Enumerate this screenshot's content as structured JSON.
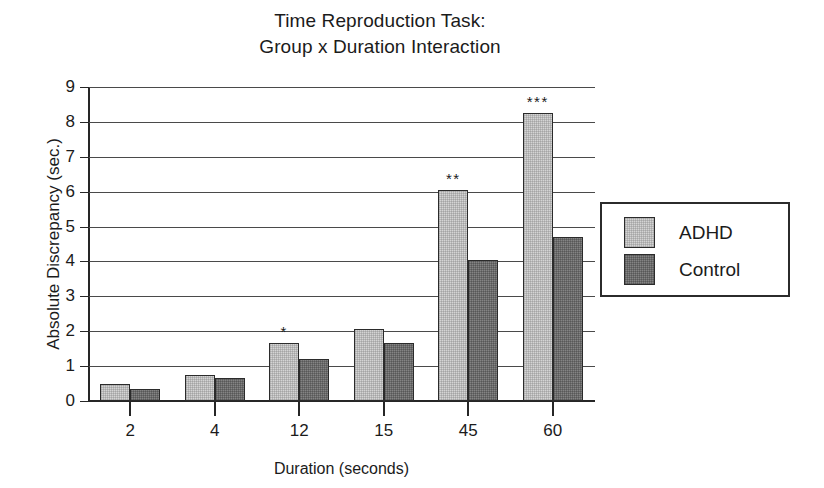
{
  "chart_data": {
    "type": "bar",
    "title": "Time Reproduction Task: Group x Duration Interaction",
    "title_lines": [
      "Time Reproduction Task:",
      "Group x Duration Interaction"
    ],
    "xlabel": "Duration (seconds)",
    "ylabel": "Absolute Discrepancy (sec.)",
    "categories": [
      "2",
      "4",
      "12",
      "15",
      "45",
      "60"
    ],
    "ylim": [
      0,
      9
    ],
    "ytick_labels": [
      "0",
      "1",
      "2",
      "3",
      "4",
      "5",
      "6",
      "7",
      "8",
      "9"
    ],
    "yticks": [
      0,
      1,
      2,
      3,
      4,
      5,
      6,
      7,
      8,
      9
    ],
    "grid": "horizontal",
    "legend_position": "right",
    "series": [
      {
        "name": "ADHD",
        "color": "#d4d4d4",
        "values": [
          0.5,
          0.75,
          1.65,
          2.05,
          6.05,
          8.25
        ],
        "annotations": [
          "",
          "",
          "*",
          "",
          "**",
          "***"
        ]
      },
      {
        "name": "Control",
        "color": "#848484",
        "values": [
          0.35,
          0.65,
          1.2,
          1.65,
          4.05,
          4.7
        ],
        "annotations": [
          "",
          "",
          "",
          "",
          "",
          ""
        ]
      }
    ],
    "significance_notes": {
      "12": "*",
      "45": "**",
      "60": "***"
    }
  }
}
